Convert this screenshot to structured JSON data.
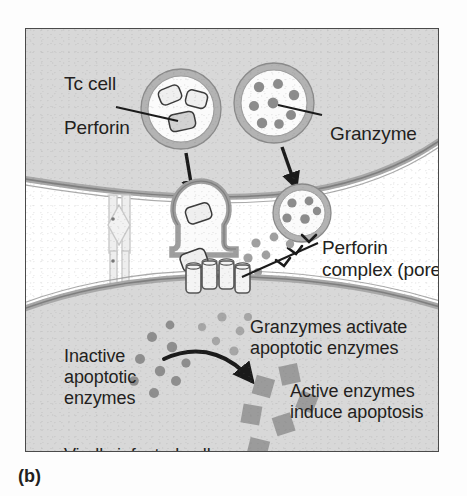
{
  "figure": {
    "caption": "(b)",
    "labels": {
      "tc_cell": "Tc cell",
      "perforin": "Perforin",
      "granzyme": "Granzyme",
      "perforin_complex_line1": "Perforin",
      "perforin_complex_line2": "complex (pore)",
      "granzymes_activate_line1": "Granzymes activate",
      "granzymes_activate_line2": "apoptotic enzymes",
      "inactive_line1": "Inactive",
      "inactive_line2": "apoptotic",
      "inactive_line3": "enzymes",
      "active_line1": "Active enzymes",
      "active_line2": "induce apoptosis",
      "virally_infected_cell": "Virally infected cell"
    },
    "colors": {
      "outer_background": "#fdfdfd",
      "panel_background": "#ffffff",
      "frame_border": "#4a4a4a",
      "cell_fill": "#d8d8d8",
      "membrane_stroke": "#9a9a9a",
      "membrane_inner": "#bdbdbd",
      "granule_dot": "#8c8c8c",
      "active_enzyme_square": "#9b9b9b",
      "arrow_dark": "#1a1a1a",
      "text": "#231f20",
      "vesicle_lumen": "#fbfbfb",
      "perforin_monomer_fill": "#efefef",
      "receptor_faint": "#e2e2e2"
    },
    "structures": {
      "tc_cell_name": "Tc cell (cytotoxic T lymphocyte)",
      "target_cell_name": "Virally infected cell",
      "perforin_vesicle_contents": 3,
      "granzyme_vesicle_contents": 8,
      "fusing_perforin_vesicle_contents": 1,
      "fusing_granzyme_vesicle_contents": 5,
      "pore_cylinder_count": 4,
      "intercellular_granzyme_dots": 7,
      "cytoplasm_granzyme_dots": 6,
      "inactive_enzyme_dots": 9,
      "active_enzyme_squares": 6
    }
  }
}
